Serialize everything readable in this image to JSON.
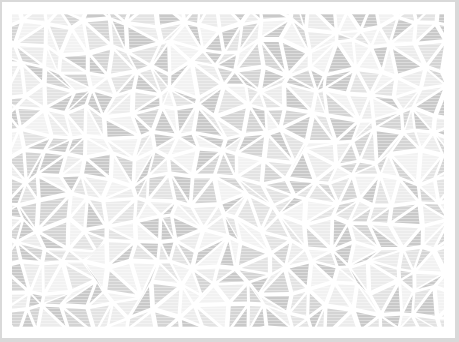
{
  "pattern": {
    "type": "triangle-mosaic",
    "outer_border_color": "#d9d9d9",
    "frame_color": "#ffffff",
    "gap_color": "#ffffff",
    "tile_colors": [
      "#c9c9c9",
      "#d4d4d4",
      "#e3e3e3",
      "#ececec",
      "#f2f2f2"
    ],
    "stripe_color": "#ffffff",
    "cell_size": 22,
    "gap_width": 3.5
  }
}
